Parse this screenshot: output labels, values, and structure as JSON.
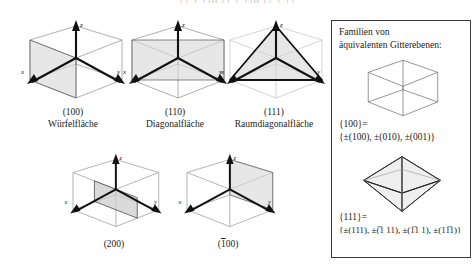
{
  "top_clipped_text": "(1 1 1)H (1 1 1)H (1 1 1)",
  "figures": [
    {
      "id": "fig-100",
      "index": "(100)",
      "name": "Würfelfläche",
      "bar": false
    },
    {
      "id": "fig-110",
      "index": "(110)",
      "name": "Diagonalfläche",
      "bar": false
    },
    {
      "id": "fig-111",
      "index": "(111)",
      "name": "Raumdiagonalfläche",
      "bar": false
    },
    {
      "id": "fig-200",
      "index": "(200)",
      "name": "",
      "bar": false
    },
    {
      "id": "fig-m100",
      "index_pre": "(",
      "index_bar": "1",
      "index_post": "00)",
      "index": "(̅1 00)",
      "name": "",
      "bar": true
    }
  ],
  "axes": {
    "x": "x",
    "y": "y",
    "z": "z"
  },
  "panel": {
    "title_line1": "Familien von",
    "title_line2": "äquivalenten Gitterebenen:",
    "group_100": {
      "label": "{100}=",
      "set": "{±(100), ±(010), ±(001)}",
      "set_parts": [
        "±(100),",
        "±(010),",
        "±(001)"
      ]
    },
    "group_111": {
      "label": "{111}=",
      "set": "{±(111), ±(̅1 11), ±(1̅1 1), ±(11̅1)}"
    }
  },
  "colors": {
    "ink": "#1a1a1a",
    "axis": "#111111",
    "cube_edge": "#8d8d8d",
    "plane_fill": "#d9d9d9",
    "panel_border": "#3a3a3a",
    "background": "#ffffff"
  }
}
